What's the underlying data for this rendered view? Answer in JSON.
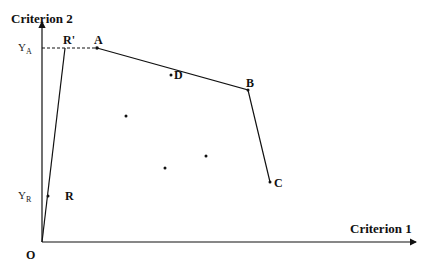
{
  "diagram": {
    "axes": {
      "y_label": "Criterion 2",
      "x_label": "Criterion 1",
      "origin_label": "O",
      "y_ticks": [
        {
          "main": "Y",
          "sub": "A"
        },
        {
          "main": "Y",
          "sub": "R"
        }
      ]
    },
    "points": {
      "R_prime": "R'",
      "A": "A",
      "D": "D",
      "B": "B",
      "C": "C",
      "R": "R"
    },
    "frontier": [
      "R'",
      "A",
      "B",
      "C"
    ],
    "unlabeled_points": 3,
    "colors": {
      "ink": "#111111",
      "background": "#ffffff"
    }
  }
}
